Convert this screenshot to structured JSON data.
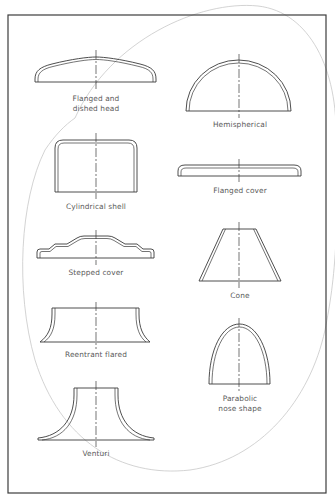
{
  "diagram": {
    "title": "",
    "frame": {
      "x": 8,
      "y": 15,
      "width": 318,
      "height": 478
    },
    "colors": {
      "line": "#3a3a3a",
      "label": "#5a5a5a",
      "background_ellipse": "#c8c8c8",
      "background": "#ffffff"
    },
    "shapes": [
      {
        "id": "flanged-dished-head",
        "label_lines": [
          "Flanged and",
          "dished head"
        ],
        "column": "left",
        "row": 1
      },
      {
        "id": "hemispherical",
        "label_lines": [
          "Hemispherical"
        ],
        "column": "right",
        "row": 1
      },
      {
        "id": "cylindrical-shell",
        "label_lines": [
          "Cylindrical shell"
        ],
        "column": "left",
        "row": 2
      },
      {
        "id": "flanged-cover",
        "label_lines": [
          "Flanged cover"
        ],
        "column": "right",
        "row": 2
      },
      {
        "id": "stepped-cover",
        "label_lines": [
          "Stepped cover"
        ],
        "column": "left",
        "row": 3
      },
      {
        "id": "cone",
        "label_lines": [
          "Cone"
        ],
        "column": "right",
        "row": 3
      },
      {
        "id": "reentrant-flared",
        "label_lines": [
          "Reentrant flared"
        ],
        "column": "left",
        "row": 4
      },
      {
        "id": "parabolic-nose-shape",
        "label_lines": [
          "Parabolic",
          "nose shape"
        ],
        "column": "right",
        "row": 4
      },
      {
        "id": "venturi",
        "label_lines": [
          "Venturi"
        ],
        "column": "left",
        "row": 5
      }
    ]
  }
}
